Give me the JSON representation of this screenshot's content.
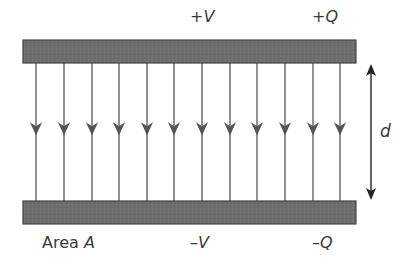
{
  "diagram": {
    "top_plate": {
      "voltage_label": "+V",
      "charge_label": "+Q"
    },
    "bottom_plate": {
      "area_prefix": "Area",
      "area_symbol": "A",
      "voltage_label": "–V",
      "charge_label": "–Q"
    },
    "separation_label": "d",
    "field_line_count": 12,
    "field_direction": "down",
    "colors": {
      "plate_fill": "#6e6e6e",
      "plate_border": "#444444",
      "line": "#555555",
      "text": "#3a3a3a"
    }
  }
}
